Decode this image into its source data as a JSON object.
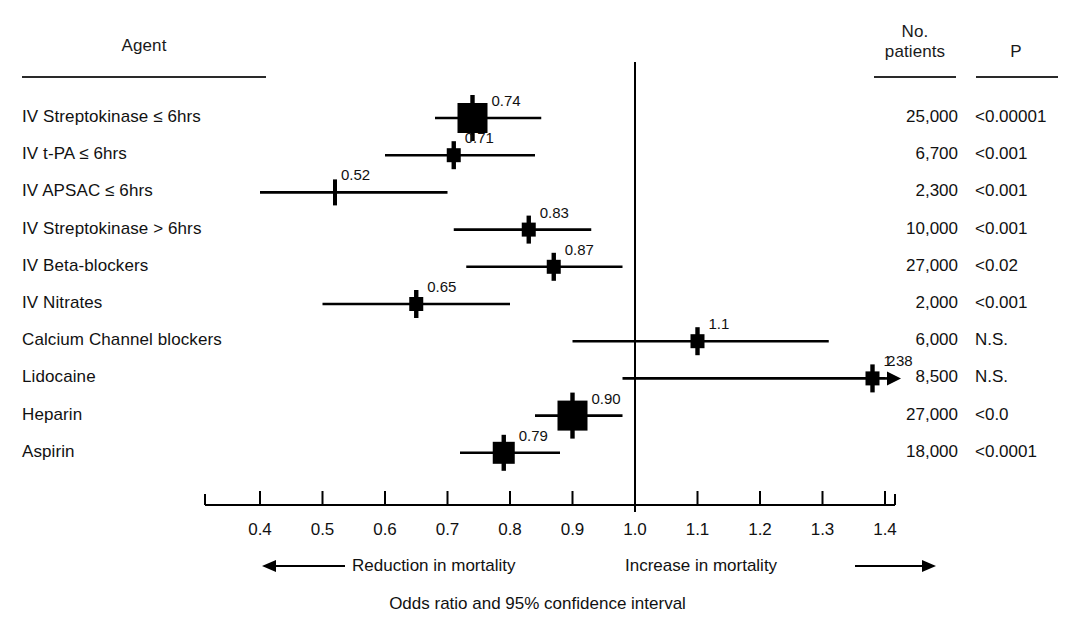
{
  "headers": {
    "agent": "Agent",
    "no_patients": "No.\npatients",
    "no_patients_line1": "No.",
    "no_patients_line2": "patients",
    "p": "P"
  },
  "axis": {
    "tick_labels": [
      "0.4",
      "0.5",
      "0.6",
      "0.7",
      "0.8",
      "0.9",
      "1.0",
      "1.1",
      "1.2",
      "1.3",
      "1.4"
    ],
    "left_direction": "Reduction in mortality",
    "right_direction": "Increase in mortality",
    "caption": "Odds ratio and 95% confidence interval"
  },
  "chart_data": {
    "type": "forest",
    "title": "",
    "xlabel": "Odds ratio and 95% confidence interval",
    "ylabel": "Agent",
    "xlim": [
      0.35,
      1.45
    ],
    "xticks": [
      0.4,
      0.5,
      0.6,
      0.7,
      0.8,
      0.9,
      1.0,
      1.1,
      1.2,
      1.3,
      1.4
    ],
    "reference_line": 1.0,
    "grid": false,
    "legend": "none",
    "columns": [
      "Agent",
      "Odds ratio",
      "No. patients",
      "P"
    ],
    "rows": [
      {
        "agent": "IV Streptokinase ≤ 6hrs",
        "or": 0.74,
        "or_label": "0.74",
        "ci_low": 0.68,
        "ci_high": 0.85,
        "marker": "large-square",
        "n": "25,000",
        "p": "<0.00001"
      },
      {
        "agent": "IV t-PA ≤ 6hrs",
        "or": 0.71,
        "or_label": "0.71",
        "ci_low": 0.6,
        "ci_high": 0.84,
        "marker": "small-square",
        "n": "6,700",
        "p": "<0.001"
      },
      {
        "agent": "IV APSAC ≤ 6hrs",
        "or": 0.52,
        "or_label": "0.52",
        "ci_low": 0.4,
        "ci_high": 0.7,
        "marker": "tick",
        "n": "2,300",
        "p": "<0.001"
      },
      {
        "agent": "IV Streptokinase > 6hrs",
        "or": 0.83,
        "or_label": "0.83",
        "ci_low": 0.71,
        "ci_high": 0.93,
        "marker": "small-square",
        "n": "10,000",
        "p": "<0.001"
      },
      {
        "agent": "IV Beta-blockers",
        "or": 0.87,
        "or_label": "0.87",
        "ci_low": 0.73,
        "ci_high": 0.98,
        "marker": "small-square",
        "n": "27,000",
        "p": "<0.02"
      },
      {
        "agent": "IV Nitrates",
        "or": 0.65,
        "or_label": "0.65",
        "ci_low": 0.5,
        "ci_high": 0.8,
        "marker": "small-square",
        "n": "2,000",
        "p": "<0.001"
      },
      {
        "agent": "Calcium Channel blockers",
        "or": 1.1,
        "or_label": "1.1",
        "ci_low": 0.9,
        "ci_high": 1.31,
        "marker": "small-square",
        "n": "6,000",
        "p": "N.S."
      },
      {
        "agent": "Lidocaine",
        "or": 1.38,
        "or_label": "1.38",
        "ci_low": 0.98,
        "ci_high": 1.4,
        "ci_high_label": "2",
        "arrow_right": true,
        "marker": "small-square",
        "n": "8,500",
        "p": "N.S."
      },
      {
        "agent": "Heparin",
        "or": 0.9,
        "or_label": "0.90",
        "ci_low": 0.84,
        "ci_high": 0.98,
        "marker": "large-square",
        "n": "27,000",
        "p": "<0.0"
      },
      {
        "agent": "Aspirin",
        "or": 0.79,
        "or_label": "0.79",
        "ci_low": 0.72,
        "ci_high": 0.88,
        "marker": "medium-square",
        "n": "18,000",
        "p": "<0.0001"
      }
    ]
  },
  "colors": {
    "ink": "#000000",
    "text": "#111111",
    "background": "#ffffff"
  }
}
